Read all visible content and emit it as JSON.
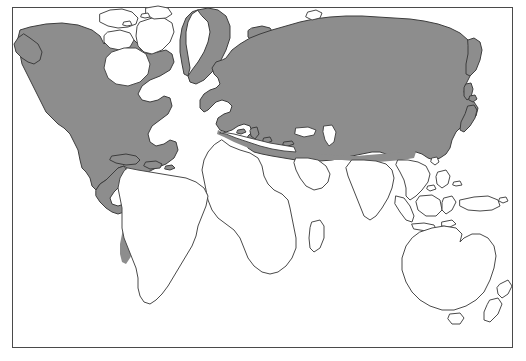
{
  "figure": {
    "type": "distribution-map",
    "title": "",
    "caption": "",
    "projection": "rectangular world map",
    "has_legend": false,
    "has_text_labels": false,
    "frame": {
      "visible": true,
      "stroke_color": "#4a4a4a",
      "x": 12,
      "y": 7,
      "width": 501,
      "height": 341
    },
    "colors": {
      "background": "#ffffff",
      "ocean": "#ffffff",
      "land_fill": "#ffffff",
      "coastline_stroke": "#4a4a4a",
      "range_fill": "#8d8d8d",
      "range_stroke": "#3d3d3d"
    }
  },
  "map_data": {
    "shaded_meaning": "distribution range (shaded gray)",
    "unshaded_meaning": "outside distribution range (white)",
    "regions_shaded": [
      "North America (mainland, Alaska to northern Mexico)",
      "Greenland coastal margins",
      "Iceland",
      "Europe (including British Isles and Scandinavia)",
      "North Africa / Mediterranean coast",
      "Northern and Central Asia (Siberia, Central Asia)",
      "Japan and Kamchatka",
      "Cuba and Hispaniola",
      "Andes mountain chain of South America"
    ],
    "regions_unshaded": [
      "Canadian Arctic Archipelago interior",
      "Greenland ice sheet interior",
      "Sub-Saharan Africa",
      "Arabian Peninsula",
      "India and Southeast Asia",
      "Indonesian archipelago",
      "Australia",
      "New Zealand",
      "Madagascar",
      "Lowland South America (Amazon, Brazil, Argentina)"
    ]
  }
}
